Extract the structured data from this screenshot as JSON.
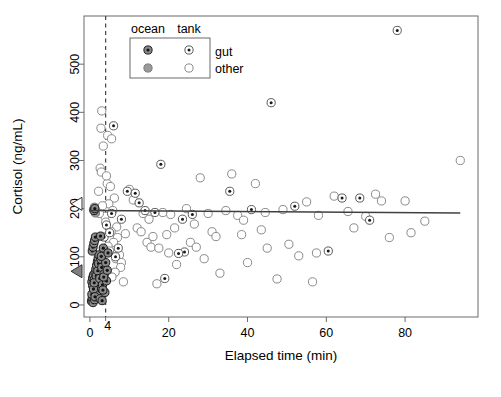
{
  "figure": {
    "width": 501,
    "height": 397,
    "background": "#ffffff"
  },
  "axes": {
    "x_label": "Elapsed time (min)",
    "y_label": "Cortisol (ng/mL)",
    "x_ticks": [
      0,
      20,
      40,
      60,
      80
    ],
    "x_tick_labels": [
      "0",
      "20",
      "40",
      "60",
      "80"
    ],
    "y_ticks": [
      0,
      100,
      200,
      300,
      400,
      500
    ],
    "y_tick_labels": [
      "0",
      "100",
      "200",
      "300",
      "400",
      "500"
    ],
    "special_x_tick": 4,
    "special_x_tick_label": "4",
    "xlim": [
      -1.5,
      98.5
    ],
    "ylim": [
      -25,
      600
    ],
    "frame_color": "#6b6b6b",
    "grid": false
  },
  "legend": {
    "col_headers": [
      "ocean",
      "tank"
    ],
    "row_labels": [
      "gut",
      "other"
    ],
    "box_color": "#6b6b6b",
    "position": "top-left-inside"
  },
  "annotations": {
    "vline": {
      "x": 4,
      "style": "dashed",
      "color": "#333333"
    },
    "regression_line": {
      "y_at_xmin": 196,
      "y_at_xmax": 191,
      "x_start": 0,
      "x_end": 94,
      "color": "#404040"
    },
    "axis_markers": [
      {
        "name": "ocean-mean-marker",
        "value": 70,
        "fill": "#808080",
        "shape": "left-triangle"
      },
      {
        "name": "tank-mean-marker",
        "value": 210,
        "fill": "#ffffff",
        "shape": "left-triangle"
      }
    ]
  },
  "colors": {
    "ocean_gut_fill": "#8a8a8a",
    "ocean_gut_edge": "#1a1a1a",
    "ocean_other_fill": "#9a9a9a",
    "ocean_other_edge": "#9a9a9a",
    "tank_gut_fill": "#ffffff",
    "tank_gut_edge": "#5a5a5a",
    "tank_gut_center": "#1a1a1a",
    "tank_other_fill": "#ffffff",
    "tank_other_edge": "#8a8a8a"
  },
  "chart_data": {
    "type": "scatter",
    "title": "",
    "xlabel": "Elapsed time (min)",
    "ylabel": "Cortisol (ng/mL)",
    "xlim": [
      -1.5,
      98.5
    ],
    "ylim": [
      -25,
      600
    ],
    "grid": false,
    "legend_position": "top-left",
    "series": [
      {
        "name": "ocean gut",
        "marker": "filled-circle-with-dot",
        "points": [
          [
            0.4,
            8
          ],
          [
            0.6,
            14
          ],
          [
            0.8,
            5
          ],
          [
            1.0,
            20
          ],
          [
            1.2,
            11
          ],
          [
            1.4,
            30
          ],
          [
            1.6,
            25
          ],
          [
            1.8,
            38
          ],
          [
            2.0,
            18
          ],
          [
            2.2,
            44
          ],
          [
            0.5,
            48
          ],
          [
            0.7,
            56
          ],
          [
            0.9,
            62
          ],
          [
            1.1,
            52
          ],
          [
            1.3,
            67
          ],
          [
            1.5,
            74
          ],
          [
            1.7,
            82
          ],
          [
            1.9,
            90
          ],
          [
            2.1,
            97
          ],
          [
            2.3,
            104
          ],
          [
            0.6,
            112
          ],
          [
            0.8,
            120
          ],
          [
            1.0,
            128
          ],
          [
            1.2,
            134
          ],
          [
            1.4,
            141
          ],
          [
            1.6,
            60
          ],
          [
            1.8,
            35
          ],
          [
            2.0,
            71
          ],
          [
            2.2,
            86
          ],
          [
            2.4,
            29
          ],
          [
            0.5,
            22
          ],
          [
            0.7,
            40
          ],
          [
            0.9,
            33
          ],
          [
            1.1,
            46
          ],
          [
            1.3,
            17
          ],
          [
            2.5,
            55
          ],
          [
            2.6,
            13
          ],
          [
            2.8,
            95
          ],
          [
            3.0,
            78
          ],
          [
            3.2,
            42
          ],
          [
            3.4,
            118
          ],
          [
            3.6,
            64
          ],
          [
            3.8,
            26
          ],
          [
            4.0,
            88
          ],
          [
            4.2,
            50
          ],
          [
            2.7,
            143
          ],
          [
            2.9,
            101
          ],
          [
            3.1,
            9
          ],
          [
            3.3,
            31
          ],
          [
            3.5,
            58
          ],
          [
            4.4,
            72
          ],
          [
            4.6,
            108
          ],
          [
            1.05,
            196
          ],
          [
            1.25,
            200
          ]
        ]
      },
      {
        "name": "ocean other",
        "marker": "filled-circle-gray",
        "points": [
          [
            0.9,
            198
          ],
          [
            1.15,
            203
          ],
          [
            1.4,
            191
          ]
        ]
      },
      {
        "name": "tank gut",
        "marker": "open-circle-with-dot",
        "points": [
          [
            78.0,
            570
          ],
          [
            46.0,
            420
          ],
          [
            6.0,
            372
          ],
          [
            18.0,
            292
          ],
          [
            9.5,
            236
          ],
          [
            11.5,
            232
          ],
          [
            5.5,
            190
          ],
          [
            8.0,
            178
          ],
          [
            14.0,
            196
          ],
          [
            16.5,
            192
          ],
          [
            24.0,
            110
          ],
          [
            22.5,
            107
          ],
          [
            23.5,
            178
          ],
          [
            26.0,
            188
          ],
          [
            41.0,
            198
          ],
          [
            52.0,
            205
          ],
          [
            60.5,
            112
          ],
          [
            64.0,
            222
          ],
          [
            68.5,
            222
          ],
          [
            71.0,
            176
          ],
          [
            35.5,
            236
          ],
          [
            4.2,
            166
          ],
          [
            3.6,
            141
          ],
          [
            5.0,
            150
          ],
          [
            6.5,
            100
          ],
          [
            7.2,
            118
          ],
          [
            19.0,
            55
          ],
          [
            12.5,
            212
          ]
        ]
      },
      {
        "name": "tank other",
        "marker": "open-circle",
        "points": [
          [
            3.0,
            403
          ],
          [
            4.5,
            352
          ],
          [
            5.5,
            345
          ],
          [
            2.8,
            367
          ],
          [
            3.4,
            330
          ],
          [
            2.6,
            284
          ],
          [
            2.9,
            276
          ],
          [
            4.4,
            252
          ],
          [
            5.2,
            246
          ],
          [
            6.2,
            222
          ],
          [
            4.8,
            210
          ],
          [
            5.8,
            196
          ],
          [
            3.8,
            184
          ],
          [
            4.0,
            172
          ],
          [
            6.8,
            162
          ],
          [
            5.4,
            152
          ],
          [
            7.0,
            140
          ],
          [
            6.0,
            130
          ],
          [
            4.6,
            122
          ],
          [
            5.0,
            112
          ],
          [
            7.5,
            104
          ],
          [
            6.6,
            96
          ],
          [
            8.0,
            88
          ],
          [
            7.8,
            78
          ],
          [
            6.4,
            68
          ],
          [
            5.6,
            58
          ],
          [
            8.5,
            48
          ],
          [
            9.0,
            148
          ],
          [
            10.0,
            240
          ],
          [
            11.0,
            218
          ],
          [
            12.0,
            160
          ],
          [
            13.0,
            152
          ],
          [
            14.5,
            130
          ],
          [
            15.5,
            120
          ],
          [
            16.0,
            142
          ],
          [
            17.0,
            44
          ],
          [
            18.5,
            192
          ],
          [
            19.5,
            146
          ],
          [
            20.5,
            188
          ],
          [
            21.5,
            160
          ],
          [
            22.0,
            84
          ],
          [
            24.5,
            200
          ],
          [
            25.5,
            130
          ],
          [
            27.0,
            120
          ],
          [
            28.0,
            264
          ],
          [
            29.0,
            96
          ],
          [
            30.0,
            190
          ],
          [
            31.0,
            152
          ],
          [
            32.0,
            142
          ],
          [
            33.0,
            66
          ],
          [
            34.5,
            196
          ],
          [
            36.0,
            272
          ],
          [
            37.5,
            186
          ],
          [
            38.5,
            146
          ],
          [
            40.0,
            88
          ],
          [
            42.0,
            252
          ],
          [
            43.5,
            156
          ],
          [
            45.0,
            118
          ],
          [
            47.5,
            54
          ],
          [
            49.0,
            198
          ],
          [
            50.5,
            126
          ],
          [
            53.0,
            102
          ],
          [
            55.0,
            214
          ],
          [
            56.5,
            48
          ],
          [
            58.0,
            186
          ],
          [
            62.0,
            226
          ],
          [
            65.5,
            194
          ],
          [
            67.0,
            160
          ],
          [
            70.0,
            184
          ],
          [
            72.5,
            230
          ],
          [
            74.0,
            216
          ],
          [
            76.0,
            140
          ],
          [
            80.0,
            216
          ],
          [
            81.5,
            150
          ],
          [
            85.0,
            174
          ],
          [
            94.0,
            300
          ],
          [
            2.4,
            190
          ],
          [
            3.2,
            206
          ],
          [
            2.2,
            236
          ],
          [
            4.2,
            268
          ],
          [
            26.5,
            168
          ],
          [
            39.0,
            176
          ],
          [
            44.5,
            192
          ],
          [
            57.5,
            108
          ],
          [
            20.0,
            108
          ],
          [
            17.5,
            118
          ],
          [
            15.0,
            178
          ],
          [
            13.5,
            190
          ]
        ]
      }
    ]
  }
}
